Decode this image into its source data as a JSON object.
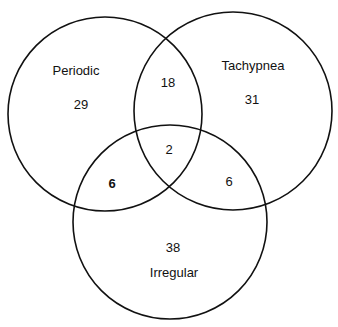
{
  "sets": {
    "periodic": {
      "label": "Periodic"
    },
    "tachypnea": {
      "label": "Tachypnea"
    },
    "irregular": {
      "label": "Irregular"
    }
  },
  "regions": {
    "periodic_only": "29",
    "tachypnea_only": "31",
    "irregular_only": "38",
    "periodic_tachypnea": "18",
    "periodic_irregular": "6",
    "tachypnea_irregular": "6",
    "all_three": "2"
  },
  "colors": {
    "stroke": "#111111",
    "background": "#ffffff"
  }
}
